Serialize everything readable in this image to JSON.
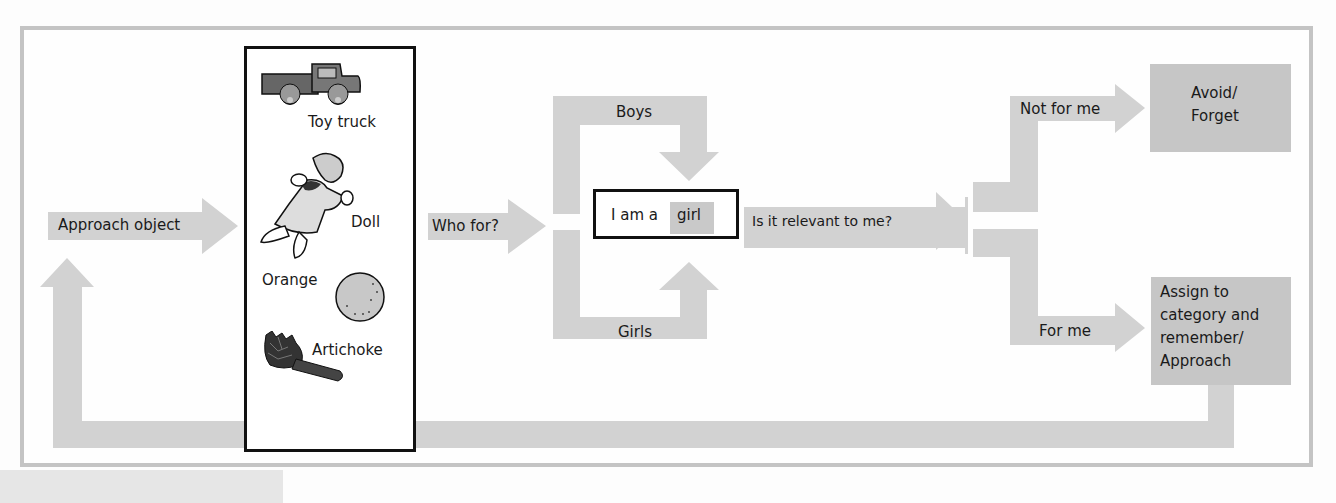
{
  "colors": {
    "arrow_fill": "#d2d2d2",
    "result_box_fill": "#c6c6c6",
    "frame_border": "#c4c4c4",
    "outline": "#111111"
  },
  "diagram": {
    "start": {
      "label": "Approach object"
    },
    "objects": {
      "items": [
        {
          "label": "Toy truck",
          "icon": "toy-truck-icon"
        },
        {
          "label": "Doll",
          "icon": "doll-icon"
        },
        {
          "label": "Orange",
          "icon": "orange-icon"
        },
        {
          "label": "Artichoke",
          "icon": "artichoke-icon"
        }
      ]
    },
    "who_for": {
      "label": "Who for?"
    },
    "branches": {
      "boys": "Boys",
      "girls": "Girls"
    },
    "identity": {
      "prefix": "I am a",
      "value": "girl"
    },
    "relevance": {
      "label": "Is it relevant  to me?"
    },
    "outcomes": {
      "not_for_me": {
        "arrow_label": "Not for me",
        "result": [
          "Avoid/",
          "Forget"
        ]
      },
      "for_me": {
        "arrow_label": "For me",
        "result": [
          "Assign to",
          "category and",
          "remember/",
          "Approach"
        ]
      }
    }
  }
}
